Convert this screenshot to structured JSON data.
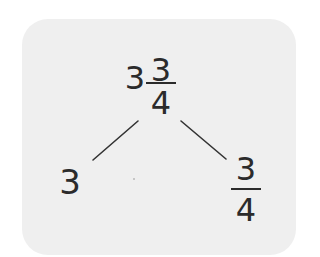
{
  "diagram": {
    "type": "number-bond",
    "root": {
      "whole": "3",
      "numerator": "3",
      "denominator": "4",
      "label": "3 3/4"
    },
    "left_part": {
      "value": "3"
    },
    "right_part": {
      "numerator": "3",
      "denominator": "4",
      "label": "3/4"
    },
    "colors": {
      "card_background": "#efefef",
      "text": "#2b2b2b"
    }
  }
}
